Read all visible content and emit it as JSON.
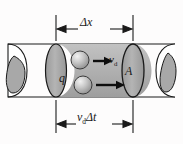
{
  "figure": {
    "type": "physics-diagram",
    "background_color": "#fdfcfc",
    "cylinder": {
      "body_fill": "#ffffff",
      "shaded_volume_fill": "#b3b3b3",
      "cross_section_fill": "#a8a8a8",
      "outline_color": "#1a1a1a"
    }
  },
  "labels": {
    "delta_x": "Δx",
    "vd_delta_t_v": "v",
    "vd_delta_t_sub": "d",
    "vd_delta_t_rest": "Δt",
    "drift_velocity_v": "v",
    "drift_velocity_sub": "d",
    "charge": "q",
    "area": "A"
  },
  "dimension_lines": {
    "top": {
      "label": "Δx",
      "left_x": 56,
      "right_x": 133,
      "y": 29
    },
    "bottom": {
      "label": "vdΔt",
      "left_x": 56,
      "right_x": 133,
      "y": 124
    }
  },
  "charge_carriers": [
    {
      "name": "upper-charge",
      "cx": 80,
      "cy": 60,
      "r": 9,
      "arrow_label": "vd"
    },
    {
      "name": "lower-charge",
      "cx": 83,
      "cy": 85,
      "r": 9,
      "arrow_label": ""
    }
  ],
  "arrows": [
    {
      "name": "upper-drift-arrow",
      "x1": 93,
      "x2": 112,
      "y": 61
    },
    {
      "name": "lower-drift-arrow",
      "x1": 96,
      "x2": 124,
      "y": 85
    }
  ]
}
